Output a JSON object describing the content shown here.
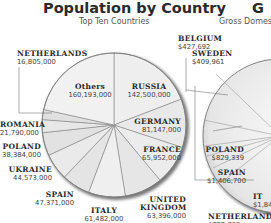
{
  "chart_data": [
    {
      "type": "pie",
      "title": "Population by Country",
      "subtitle": "Top Ten Countries",
      "categories": [
        "Russia",
        "Germany",
        "France",
        "United Kingdom",
        "Italy",
        "Spain",
        "Ukraine",
        "Poland",
        "Romania",
        "Netherlands",
        "Others"
      ],
      "values": [
        142500000,
        81147000,
        65952000,
        63396000,
        61482000,
        47371000,
        44573000,
        38384000,
        21790000,
        16805000,
        160193000
      ],
      "labels": {
        "russia": {
          "name": "RUSSIA",
          "value": "142,500,000"
        },
        "germany": {
          "name": "GERMANY",
          "value": "81,147,000"
        },
        "france": {
          "name": "FRANCE",
          "value": "65,952,000"
        },
        "uk_line1": "UNITED",
        "uk_line2": "KINGDOM",
        "uk_value": "63,396,000",
        "italy": {
          "name": "ITALY",
          "value": "61,482,000"
        },
        "spain": {
          "name": "SPAIN",
          "value": "47,371,000"
        },
        "ukraine": {
          "name": "UKRAINE",
          "value": "44,573,000"
        },
        "poland": {
          "name": "POLAND",
          "value": "38,384,000"
        },
        "romania": {
          "name": "ROMANIA",
          "value": "21,790,000"
        },
        "netherlands": {
          "name": "NETHERLANDS",
          "value": "16,805,000"
        },
        "others": {
          "name": "Others",
          "value": "160,193,000"
        }
      }
    },
    {
      "type": "pie",
      "title": "G",
      "subtitle": "Gross Domest",
      "partial": true,
      "labels": {
        "belgium": {
          "name": "BELGIUM",
          "value": "$427,692"
        },
        "sweden": {
          "name": "SWEDEN",
          "value": "$409,961"
        },
        "poland": {
          "name": "POLAND",
          "value": "$829,339"
        },
        "spain": {
          "name": "SPAIN",
          "value": "$1,406,700"
        },
        "italy": {
          "name": "IT",
          "value": "$1,844"
        },
        "netherlands": {
          "name": "NETHERLANDS",
          "value": "$722,700"
        }
      }
    }
  ],
  "colors": {
    "slice": "#ececec",
    "slice_edge": "#8a8a8a",
    "rim": "#6f6f6f",
    "text": "#2a2a2a"
  }
}
